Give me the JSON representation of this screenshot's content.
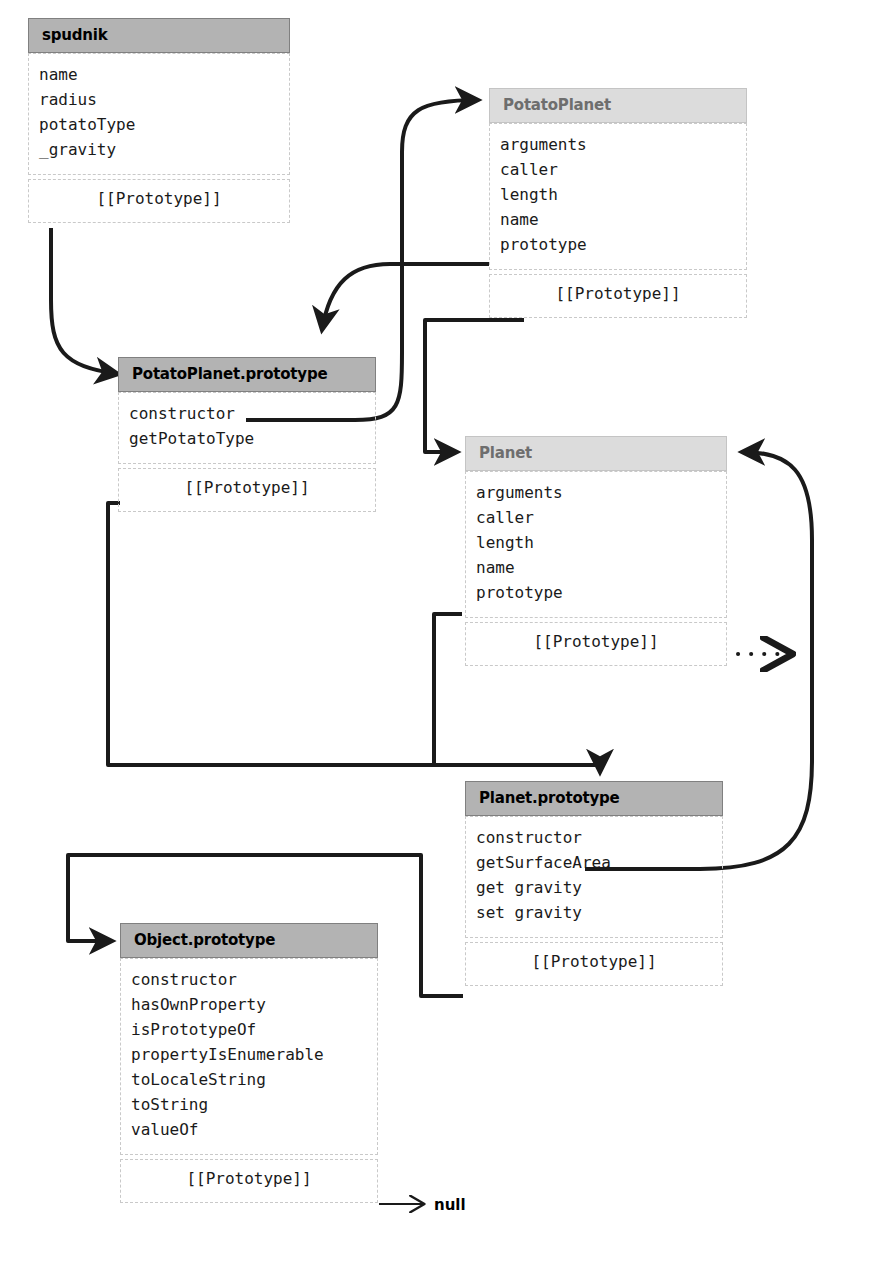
{
  "diagram": {
    "colors": {
      "object_header_bg": "#b3b3b3",
      "function_header_bg": "#dcdcdc",
      "object_header_text": "#000000",
      "function_header_text": "#6e6e6e",
      "dashed_border": "#c9c9c9",
      "connector": "#1a1a1a",
      "background": "#ffffff"
    },
    "proto_label": "[[Prototype]]",
    "terminal_value": "null"
  },
  "boxes": {
    "spudnik": {
      "title": "spudnik",
      "kind": "object",
      "properties": [
        "name",
        "radius",
        "potatoType",
        "_gravity"
      ],
      "proto": "[[Prototype]]"
    },
    "potatoPlanet": {
      "title": "PotatoPlanet",
      "kind": "function",
      "properties": [
        "arguments",
        "caller",
        "length",
        "name",
        "prototype"
      ],
      "proto": "[[Prototype]]"
    },
    "potatoPlanetPrototype": {
      "title": "PotatoPlanet.prototype",
      "kind": "object",
      "properties": [
        "constructor",
        "getPotatoType"
      ],
      "proto": "[[Prototype]]"
    },
    "planet": {
      "title": "Planet",
      "kind": "function",
      "properties": [
        "arguments",
        "caller",
        "length",
        "name",
        "prototype"
      ],
      "proto": "[[Prototype]]"
    },
    "planetPrototype": {
      "title": "Planet.prototype",
      "kind": "object",
      "properties": [
        "constructor",
        "getSurfaceArea",
        "get gravity",
        "set gravity"
      ],
      "proto": "[[Prototype]]"
    },
    "objectPrototype": {
      "title": "Object.prototype",
      "kind": "object",
      "properties": [
        "constructor",
        "hasOwnProperty",
        "isPrototypeOf",
        "propertyIsEnumerable",
        "toLocaleString",
        "toString",
        "valueOf"
      ],
      "proto": "[[Prototype]]"
    }
  },
  "edges": [
    {
      "name": "spudnik-proto-to-potatoplanet-prototype",
      "from": "spudnik.[[Prototype]]",
      "to": "PotatoPlanet.prototype",
      "style": "solid-arrow"
    },
    {
      "name": "potatoplanet-prototype-prop-to-potatoplanet-prototype-object",
      "from": "PotatoPlanet.prototype (property)",
      "to": "PotatoPlanet.prototype (object)",
      "style": "solid-arrow"
    },
    {
      "name": "potatoplanet-prototype-constructor-to-potatoplanet",
      "from": "PotatoPlanet.prototype.constructor",
      "to": "PotatoPlanet",
      "style": "solid-arrow"
    },
    {
      "name": "potatoplanet-proto-to-planet",
      "from": "PotatoPlanet.[[Prototype]]",
      "to": "Planet",
      "style": "solid-arrow"
    },
    {
      "name": "potatoplanet-prototype-proto-to-planet-prototype",
      "from": "PotatoPlanet.prototype.[[Prototype]]",
      "to": "Planet.prototype",
      "style": "solid-arrow"
    },
    {
      "name": "planet-prototype-prop-to-planet-prototype-object",
      "from": "Planet.prototype (property)",
      "to": "Planet.prototype (object)",
      "style": "solid-arrow"
    },
    {
      "name": "planet-prototype-constructor-to-planet",
      "from": "Planet.prototype.constructor",
      "to": "Planet",
      "style": "solid-arrow"
    },
    {
      "name": "planet-proto-continues-offpage",
      "from": "Planet.[[Prototype]]",
      "to": "(off page)",
      "style": "dotted-arrow"
    },
    {
      "name": "planet-prototype-proto-to-object-prototype",
      "from": "Planet.prototype.[[Prototype]]",
      "to": "Object.prototype",
      "style": "solid-arrow"
    },
    {
      "name": "object-prototype-proto-to-null",
      "from": "Object.prototype.[[Prototype]]",
      "to": "null",
      "style": "thin-arrow"
    }
  ]
}
